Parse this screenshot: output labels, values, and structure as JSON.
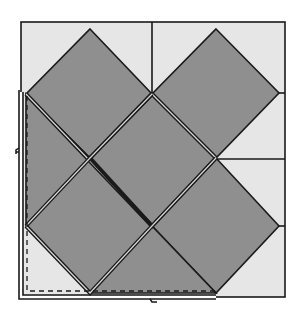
{
  "diagram": {
    "title": "",
    "colors": {
      "background": "#ffffff",
      "setting_triangle_fill": "#e6e6e6",
      "square_fill": "#8f8f8f",
      "stroke": "#1a1a1a",
      "double_line_gap": "#ffffff"
    },
    "outer_square": {
      "x": 21,
      "y": 22,
      "w": 264,
      "h": 275
    },
    "squares_on_point": [
      {
        "id": "top-left",
        "points": "90,29 152,94 90,158 26,94"
      },
      {
        "id": "top-right",
        "points": "216,29 279,93 216,158 152,94"
      },
      {
        "id": "center",
        "points": "152,94 216,158 152,226 90,158"
      },
      {
        "id": "mid-left",
        "points": "90,158 152,226 90,293 26,226"
      },
      {
        "id": "bottom-right",
        "points": "216,158 279,226 216,293 152,226"
      },
      {
        "id": "left-strip-top",
        "points": "26,94 90,158 26,226"
      },
      {
        "id": "bottom-strip",
        "points": "90,293 152,226 216,293"
      }
    ],
    "seam_lines": [
      {
        "id": "top-divider",
        "x1": 152,
        "y1": 22,
        "x2": 152,
        "y2": 94
      },
      {
        "id": "right-tick-top",
        "x1": 279,
        "y1": 93,
        "x2": 285,
        "y2": 93
      },
      {
        "id": "right-divider",
        "x1": 216,
        "y1": 159,
        "x2": 285,
        "y2": 159
      },
      {
        "id": "right-tick-bottom",
        "x1": 279,
        "y1": 226,
        "x2": 285,
        "y2": 226
      }
    ],
    "highlight_region": {
      "shape": "L",
      "outer_path": "M21,92 L21,297 L216,297",
      "dashed_path": "M27,96 L27,291 L216,291",
      "notches": [
        {
          "x": 21,
          "y": 150
        },
        {
          "x": 152,
          "y": 297
        }
      ]
    }
  }
}
